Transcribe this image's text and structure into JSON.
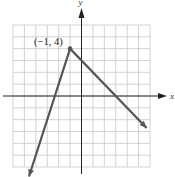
{
  "chart_data": {
    "type": "line",
    "title": "",
    "xlabel": "x",
    "ylabel": "y",
    "xlim": [
      -6,
      6
    ],
    "ylim": [
      -6,
      6
    ],
    "grid": true,
    "series": [
      {
        "name": "piecewise linear graph",
        "x": [
          -4.6,
          -1,
          5.7
        ],
        "y": [
          -6.8,
          4,
          -2.7
        ]
      }
    ],
    "annotations": [
      {
        "text": "(−1, 4)",
        "x": -1,
        "y": 4,
        "marker": "dot"
      }
    ],
    "colors": {
      "grid": "#c8c8c8",
      "axes": "#222222",
      "line": "#555555"
    }
  },
  "labels": {
    "x_axis": "x",
    "y_axis": "y",
    "vertex": "(−1, 4)"
  }
}
